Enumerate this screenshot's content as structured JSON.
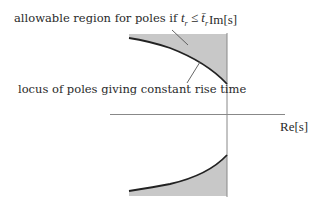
{
  "diagram": {
    "type": "s-plane pole region",
    "axes": {
      "imag_label": "Im[s]",
      "real_label": "Re[s]"
    },
    "annotations": {
      "allowable_region_prefix": "allowable region for poles if ",
      "allowable_region_condition": "t",
      "allowable_region_sub": "r",
      "allowable_region_op": " ≤ ",
      "allowable_region_bound": "t̄",
      "allowable_region_bound_sub": "r",
      "locus": "locus of poles giving constant rise time"
    },
    "colors": {
      "fill": "#c8c8c8",
      "curve": "#222222",
      "axis": "#888888",
      "text": "#2a2a2a"
    }
  }
}
